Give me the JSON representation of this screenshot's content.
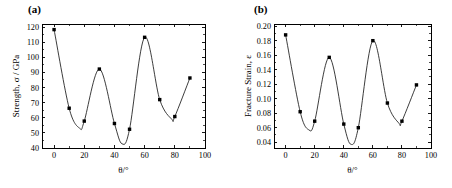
{
  "figure": {
    "background_color": "#ffffff",
    "foreground_color": "#000000",
    "panels": [
      {
        "label": "(a)",
        "name": "panel-a-strength"
      },
      {
        "label": "(b)",
        "name": "panel-b-fracture-strain"
      }
    ]
  },
  "chart_data": [
    {
      "type": "line",
      "panel_label": "(a)",
      "title": "",
      "xlabel": "θ/°",
      "ylabel": "Strength, σ / GPa",
      "xlim": [
        -8,
        100
      ],
      "ylim": [
        40,
        122
      ],
      "xticks": [
        0,
        20,
        40,
        60,
        80,
        100
      ],
      "xtick_labels": [
        "0",
        "20",
        "40",
        "60",
        "80",
        "100"
      ],
      "xminor_ticks": [
        10,
        30,
        50,
        70,
        90
      ],
      "yticks": [
        40,
        50,
        60,
        70,
        80,
        90,
        100,
        110,
        120
      ],
      "ytick_labels": [
        "40",
        "50",
        "60",
        "70",
        "80",
        "90",
        "100",
        "110",
        "120"
      ],
      "grid": false,
      "legend": false,
      "marker": "filled-square",
      "x": [
        0,
        10,
        20,
        30,
        40,
        45,
        50,
        60,
        70,
        80,
        90
      ],
      "values": [
        118.3,
        66.3,
        57.8,
        92.2,
        56.2,
        null,
        52.4,
        113.2,
        72.0,
        60.8,
        86.3
      ],
      "series": [
        {
          "name": "Strength",
          "x": [
            0,
            10,
            20,
            30,
            40,
            50,
            60,
            70,
            80,
            90
          ],
          "values": [
            118.3,
            66.3,
            57.8,
            92.2,
            56.2,
            52.4,
            113.2,
            72.0,
            60.8,
            86.3
          ]
        }
      ],
      "curve_minima": [
        {
          "x": 17,
          "y": 53.0
        },
        {
          "x": 45,
          "y": 42.8
        },
        {
          "x": 78,
          "y": 59.0
        }
      ]
    },
    {
      "type": "line",
      "panel_label": "(b)",
      "title": "",
      "xlabel": "θ/°",
      "ylabel": "Fracture Strain, ε",
      "xlim": [
        -8,
        100
      ],
      "ylim": [
        0.032,
        0.203
      ],
      "xticks": [
        0,
        20,
        40,
        60,
        80,
        100
      ],
      "xtick_labels": [
        "0",
        "20",
        "40",
        "60",
        "80",
        "100"
      ],
      "xminor_ticks": [
        10,
        30,
        50,
        70,
        90
      ],
      "yticks": [
        0.04,
        0.06,
        0.08,
        0.1,
        0.12,
        0.14,
        0.16,
        0.18,
        0.2
      ],
      "ytick_labels": [
        "0.04",
        "0.06",
        "0.08",
        "0.10",
        "0.12",
        "0.14",
        "0.16",
        "0.18",
        "0.20"
      ],
      "grid": false,
      "legend": false,
      "marker": "filled-square",
      "x": [
        0,
        10,
        20,
        30,
        40,
        50,
        60,
        70,
        80,
        90
      ],
      "values": [
        0.188,
        0.082,
        0.069,
        0.157,
        0.065,
        0.06,
        0.18,
        0.094,
        0.069,
        0.119
      ],
      "series": [
        {
          "name": "Fracture Strain",
          "x": [
            0,
            10,
            20,
            30,
            40,
            50,
            60,
            70,
            80,
            90
          ],
          "values": [
            0.188,
            0.082,
            0.069,
            0.157,
            0.065,
            0.06,
            0.18,
            0.094,
            0.069,
            0.119
          ]
        }
      ],
      "curve_minima": [
        {
          "x": 16,
          "y": 0.057
        },
        {
          "x": 45,
          "y": 0.037
        },
        {
          "x": 78,
          "y": 0.066
        }
      ]
    }
  ]
}
